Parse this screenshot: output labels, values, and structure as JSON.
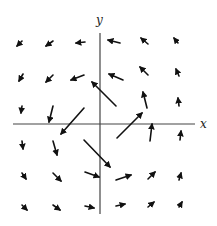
{
  "figure": {
    "type": "vector-field",
    "width": 217,
    "height": 226,
    "colors": {
      "axis": "#444444",
      "arrow": "#111111",
      "background": "#ffffff"
    },
    "axes": {
      "origin": [
        100,
        124
      ],
      "x_axis": {
        "from": [
          13,
          124
        ],
        "to": [
          195,
          124
        ],
        "label": "x",
        "label_pos": [
          200,
          128
        ]
      },
      "y_axis": {
        "from": [
          100,
          33
        ],
        "to": [
          100,
          214
        ],
        "label": "y",
        "label_pos": [
          96,
          24
        ]
      }
    },
    "arrows": [
      {
        "row": 1,
        "col": 1,
        "tail": [
          22,
          41
        ],
        "head": [
          17,
          46
        ]
      },
      {
        "row": 1,
        "col": 2,
        "tail": [
          53,
          41
        ],
        "head": [
          46,
          46
        ]
      },
      {
        "row": 1,
        "col": 3,
        "tail": [
          85,
          42
        ],
        "head": [
          76,
          43
        ]
      },
      {
        "row": 1,
        "col": 4,
        "tail": [
          120,
          43
        ],
        "head": [
          108,
          40
        ]
      },
      {
        "row": 1,
        "col": 5,
        "tail": [
          148,
          44
        ],
        "head": [
          141,
          38
        ]
      },
      {
        "row": 1,
        "col": 6,
        "tail": [
          178,
          43
        ],
        "head": [
          174,
          38
        ]
      },
      {
        "row": 2,
        "col": 1,
        "tail": [
          23,
          74
        ],
        "head": [
          19,
          81
        ]
      },
      {
        "row": 2,
        "col": 2,
        "tail": [
          53,
          75
        ],
        "head": [
          46,
          82
        ]
      },
      {
        "row": 2,
        "col": 3,
        "tail": [
          84,
          75
        ],
        "head": [
          71,
          80
        ]
      },
      {
        "row": 2,
        "col": 4,
        "tail": [
          123,
          80
        ],
        "head": [
          109,
          74
        ]
      },
      {
        "row": 2,
        "col": 5,
        "tail": [
          148,
          75
        ],
        "head": [
          140,
          67
        ]
      },
      {
        "row": 2,
        "col": 6,
        "tail": [
          179,
          76
        ],
        "head": [
          176,
          69
        ]
      },
      {
        "row": 3,
        "col": 1,
        "tail": [
          22,
          106
        ],
        "head": [
          21,
          113
        ]
      },
      {
        "row": 3,
        "col": 2,
        "tail": [
          53,
          106
        ],
        "head": [
          49,
          122
        ]
      },
      {
        "row": 3,
        "col": 3,
        "tail": [
          84,
          108
        ],
        "head": [
          61,
          134
        ]
      },
      {
        "row": 3,
        "col": 4,
        "tail": [
          116,
          106
        ],
        "head": [
          92,
          82
        ]
      },
      {
        "row": 3,
        "col": 5,
        "tail": [
          147,
          108
        ],
        "head": [
          143,
          92
        ]
      },
      {
        "row": 3,
        "col": 6,
        "tail": [
          179,
          106
        ],
        "head": [
          178,
          98
        ]
      },
      {
        "row": 4,
        "col": 1,
        "tail": [
          22,
          141
        ],
        "head": [
          23,
          149
        ]
      },
      {
        "row": 4,
        "col": 2,
        "tail": [
          53,
          141
        ],
        "head": [
          57,
          155
        ]
      },
      {
        "row": 4,
        "col": 3,
        "tail": [
          84,
          140
        ],
        "head": [
          110,
          167
        ]
      },
      {
        "row": 4,
        "col": 4,
        "tail": [
          117,
          138
        ],
        "head": [
          142,
          113
        ]
      },
      {
        "row": 4,
        "col": 5,
        "tail": [
          150,
          141
        ],
        "head": [
          152,
          124
        ]
      },
      {
        "row": 4,
        "col": 6,
        "tail": [
          180,
          140
        ],
        "head": [
          181,
          131
        ]
      },
      {
        "row": 5,
        "col": 1,
        "tail": [
          22,
          173
        ],
        "head": [
          26,
          179
        ]
      },
      {
        "row": 5,
        "col": 2,
        "tail": [
          53,
          173
        ],
        "head": [
          61,
          181
        ]
      },
      {
        "row": 5,
        "col": 3,
        "tail": [
          85,
          172
        ],
        "head": [
          99,
          177
        ]
      },
      {
        "row": 5,
        "col": 4,
        "tail": [
          116,
          180
        ],
        "head": [
          131,
          175
        ]
      },
      {
        "row": 5,
        "col": 5,
        "tail": [
          148,
          179
        ],
        "head": [
          155,
          172
        ]
      },
      {
        "row": 5,
        "col": 6,
        "tail": [
          179,
          180
        ],
        "head": [
          181,
          173
        ]
      },
      {
        "row": 6,
        "col": 1,
        "tail": [
          22,
          205
        ],
        "head": [
          27,
          210
        ]
      },
      {
        "row": 6,
        "col": 2,
        "tail": [
          53,
          205
        ],
        "head": [
          60,
          210
        ]
      },
      {
        "row": 6,
        "col": 3,
        "tail": [
          85,
          206
        ],
        "head": [
          94,
          208
        ]
      },
      {
        "row": 6,
        "col": 4,
        "tail": [
          116,
          206
        ],
        "head": [
          125,
          204
        ]
      },
      {
        "row": 6,
        "col": 5,
        "tail": [
          148,
          207
        ],
        "head": [
          154,
          202
        ]
      },
      {
        "row": 6,
        "col": 6,
        "tail": [
          179,
          207
        ],
        "head": [
          182,
          202
        ]
      }
    ]
  }
}
